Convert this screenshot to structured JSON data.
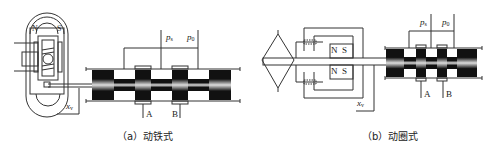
{
  "figure": {
    "panels": [
      {
        "id": "a",
        "caption": "（a）动铁式",
        "magnet_labels": [
          "N",
          "S"
        ],
        "pressure_labels": {
          "supply": "p",
          "supply_sub": "s",
          "return": "p",
          "return_sub": "0"
        },
        "port_labels": [
          "A",
          "B"
        ],
        "displacement_label": "x",
        "displacement_sub": "v"
      },
      {
        "id": "b",
        "caption": "（b）动圈式",
        "magnet_labels": [
          "N",
          "S",
          "N",
          "S"
        ],
        "pressure_labels": {
          "supply": "p",
          "supply_sub": "s",
          "return": "p",
          "return_sub": "0"
        },
        "port_labels": [
          "A",
          "B"
        ],
        "displacement_label": "x",
        "displacement_sub": "v"
      }
    ],
    "colors": {
      "line": "#333333",
      "spool": "#111111",
      "background": "#ffffff"
    }
  }
}
